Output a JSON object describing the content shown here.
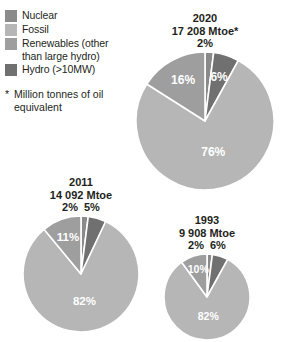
{
  "legend": {
    "items": [
      {
        "label": "Nuclear",
        "color": "#8a8a8a",
        "key": "nuclear"
      },
      {
        "label": "Fossil",
        "color": "#b6b6b6",
        "key": "fossil"
      },
      {
        "label": "Renewables (other",
        "label_cont": "than large hydro)",
        "color": "#9e9e9e",
        "key": "renewables"
      },
      {
        "label": "Hydro (>10MW)",
        "color": "#707070",
        "key": "hydro"
      }
    ]
  },
  "footnote": {
    "marker": "*",
    "text": "Million tonnes of oil equivalent"
  },
  "chart_data": [
    {
      "type": "pie",
      "title": "2020",
      "subtitle": "17 208 Mtoe*",
      "total_mtoe": 17208,
      "categories": [
        "Nuclear",
        "Hydro (>10MW)",
        "Fossil",
        "Renewables (other than large hydro)"
      ],
      "values": [
        2,
        6,
        76,
        16
      ],
      "labels": [
        "2%",
        "6%",
        "76%",
        "16%"
      ],
      "colors": [
        "#8a8a8a",
        "#707070",
        "#b6b6b6",
        "#9e9e9e"
      ],
      "external_labels": [
        "2%"
      ],
      "radius_px": 69,
      "start_angle_deg": 0
    },
    {
      "type": "pie",
      "title": "2011",
      "subtitle": "14 092 Mtoe",
      "total_mtoe": 14092,
      "categories": [
        "Nuclear",
        "Hydro (>10MW)",
        "Fossil",
        "Renewables (other than large hydro)"
      ],
      "values": [
        2,
        5,
        82,
        11
      ],
      "labels": [
        "2%",
        "5%",
        "82%",
        "11%"
      ],
      "colors": [
        "#8a8a8a",
        "#707070",
        "#b6b6b6",
        "#9e9e9e"
      ],
      "external_labels": [
        "2%",
        "5%"
      ],
      "radius_px": 58,
      "start_angle_deg": 0
    },
    {
      "type": "pie",
      "title": "1993",
      "subtitle": "9 908 Mtoe",
      "total_mtoe": 9908,
      "categories": [
        "Nuclear",
        "Hydro (>10MW)",
        "Fossil",
        "Renewables (other than large hydro)"
      ],
      "values": [
        2,
        6,
        82,
        10
      ],
      "labels": [
        "2%",
        "6%",
        "82%",
        "10%"
      ],
      "colors": [
        "#8a8a8a",
        "#707070",
        "#b6b6b6",
        "#9e9e9e"
      ],
      "external_labels": [
        "2%",
        "6%"
      ],
      "radius_px": 43,
      "start_angle_deg": 0
    }
  ],
  "layout": {
    "background": "#ffffff",
    "text_color": "#231f20",
    "slice_gap_color": "#ffffff",
    "pies": [
      {
        "key": "y2020",
        "cx": 203,
        "cy": 126,
        "top": 12,
        "left": 134
      },
      {
        "key": "y2011",
        "cx": 79,
        "cy": 270,
        "top": 176,
        "left": 21
      },
      {
        "key": "y1993",
        "cx": 205,
        "cy": 294,
        "top": 214,
        "left": 162
      }
    ]
  }
}
